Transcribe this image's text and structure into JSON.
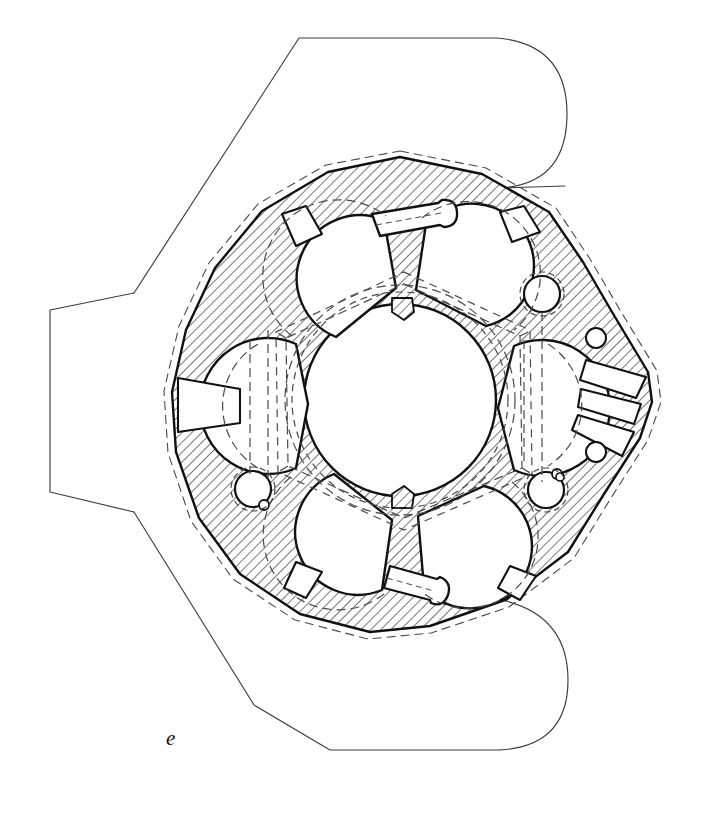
{
  "figure": {
    "label": "e",
    "label_position": {
      "x": 166,
      "y": 728
    },
    "caption": "",
    "medium": "line drawing",
    "drawing_type": "architectural floor plan",
    "background_color": "#ffffff",
    "ink_color": "#1a1a1a",
    "thin_line_color": "#3a3a3a",
    "hatch_color": "#2a2a2a",
    "canvas": {
      "width": 704,
      "height": 815
    }
  },
  "plan": {
    "title": "",
    "subject": "centralized octagonal domed building with six apses",
    "line_styles": {
      "solid_heavy": "cut masonry outline",
      "solid_thin": "outer precinct boundary",
      "dashed": "projected vaults and dome above"
    },
    "elements": {
      "outer_precinct_label": "outer enclosure wall",
      "masonry_label": "hatched masonry wall (section cut)",
      "central_dome_label": "central dome circle (dashed, projected)",
      "dome_polygon_label": "dashed octagonal arcade below dome",
      "apse_label": "semicircular apse niche",
      "wedge_label": "radiating wedge window opening",
      "column_label": "circular column / pier",
      "portal_label": "rectangular portal vestibule"
    },
    "counts": {
      "apses": 6,
      "wedge_windows_right": 3,
      "wedge_windows_left": 1,
      "portals": 2,
      "columns": 6
    }
  },
  "geometry": {
    "precinct_outline": "M 298,37 L 495,37 Q 566,44 566,113 Q 566,183 496,188 L 300,38 Z",
    "center": {
      "x": 400,
      "y": 400
    },
    "dome_radius": 115,
    "arcade_radius": 132,
    "octagon_outer_radius": 243
  }
}
